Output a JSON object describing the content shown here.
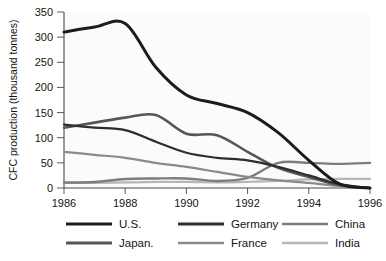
{
  "chart_data": {
    "type": "line",
    "title": "",
    "subtitle": "",
    "xlabel": "",
    "ylabel": "CFC production (thousand tonnes)",
    "xlim": [
      1986,
      1996
    ],
    "ylim": [
      0,
      350
    ],
    "xticks": [
      1986,
      1988,
      1990,
      1992,
      1994,
      1996
    ],
    "xticklabels": [
      "1986",
      "1988",
      "1990",
      "1992",
      "1994",
      "1996"
    ],
    "yticks": [
      0,
      50,
      100,
      150,
      200,
      250,
      300,
      350
    ],
    "yticklabels": [
      "0",
      "50",
      "100",
      "150",
      "200",
      "250",
      "300",
      "350"
    ],
    "grid": false,
    "legend_position": "bottom",
    "x": [
      1986,
      1987,
      1988,
      1989,
      1990,
      1991,
      1992,
      1993,
      1994,
      1995,
      1996
    ],
    "series": [
      {
        "name": "U.S.",
        "color": "#1c1c1c",
        "width": 3.0,
        "values": [
          310,
          320,
          327,
          240,
          185,
          168,
          150,
          110,
          55,
          8,
          0
        ]
      },
      {
        "name": "Germany",
        "color": "#2e2e2e",
        "width": 2.2,
        "values": [
          126,
          120,
          115,
          92,
          70,
          60,
          55,
          42,
          25,
          8,
          0
        ]
      },
      {
        "name": "China",
        "color": "#7d7d7d",
        "width": 2.4,
        "values": [
          11,
          12,
          18,
          19,
          19,
          14,
          20,
          50,
          50,
          48,
          50
        ]
      },
      {
        "name": "Japan.",
        "color": "#565656",
        "width": 2.6,
        "values": [
          120,
          130,
          140,
          145,
          108,
          105,
          72,
          40,
          22,
          6,
          0
        ]
      },
      {
        "name": "France",
        "color": "#8a8a8a",
        "width": 2.2,
        "values": [
          72,
          66,
          60,
          50,
          42,
          32,
          22,
          15,
          10,
          4,
          0
        ]
      },
      {
        "name": "India",
        "color": "#b6b6b6",
        "width": 2.2,
        "values": [
          10,
          10,
          11,
          12,
          12,
          11,
          12,
          14,
          17,
          18,
          18
        ]
      }
    ],
    "legend": [
      {
        "label": "U.S.",
        "color": "#1c1c1c",
        "width": 3.0
      },
      {
        "label": "Germany",
        "color": "#2e2e2e",
        "width": 3.2
      },
      {
        "label": "China",
        "color": "#7d7d7d",
        "width": 2.6
      },
      {
        "label": "Japan.",
        "color": "#565656",
        "width": 2.8
      },
      {
        "label": "France",
        "color": "#8a8a8a",
        "width": 2.6
      },
      {
        "label": "India",
        "color": "#b6b6b6",
        "width": 2.6
      }
    ]
  }
}
